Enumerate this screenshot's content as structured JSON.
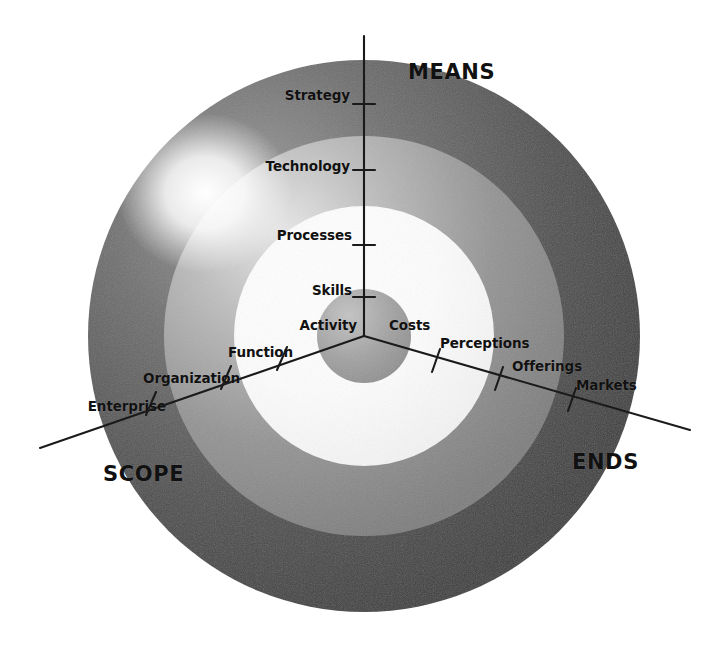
{
  "diagram": {
    "type": "concentric-ring-framework",
    "title_visible": false,
    "center": {
      "x": 364,
      "y": 336
    },
    "axes": [
      {
        "id": "means",
        "name": "MEANS",
        "label": "MEANS",
        "label_x": 456,
        "label_y": 73,
        "direction_deg": -90,
        "scale": [
          {
            "label": "Activity",
            "level": 1,
            "x": 352,
            "y": 325
          },
          {
            "label": "Skills",
            "level": 2,
            "x": 352,
            "y": 291
          },
          {
            "label": "Processes",
            "level": 3,
            "x": 352,
            "y": 235
          },
          {
            "label": "Technology",
            "level": 4,
            "x": 352,
            "y": 167
          },
          {
            "label": "Strategy",
            "level": 5,
            "x": 352,
            "y": 95
          }
        ]
      },
      {
        "id": "scope",
        "name": "SCOPE",
        "label": "SCOPE",
        "label_x": 105,
        "label_y": 474,
        "direction_deg": 199,
        "scale": [
          {
            "label": "Activity",
            "level": 1,
            "x": 354,
            "y": 325
          },
          {
            "label": "Function",
            "level": 2,
            "x": 290,
            "y": 353
          },
          {
            "label": "Organization",
            "level": 3,
            "x": 237,
            "y": 379
          },
          {
            "label": "Enterprise",
            "level": 4,
            "x": 163,
            "y": 407
          }
        ]
      },
      {
        "id": "ends",
        "name": "ENDS",
        "label": "ENDS",
        "label_x": 572,
        "label_y": 462,
        "direction_deg": -19,
        "scale": [
          {
            "label": "Costs",
            "level": 1,
            "x": 386,
            "y": 325
          },
          {
            "label": "Perceptions",
            "level": 2,
            "x": 440,
            "y": 343
          },
          {
            "label": "Offerings",
            "level": 3,
            "x": 512,
            "y": 366
          },
          {
            "label": "Markets",
            "level": 4,
            "x": 576,
            "y": 385
          }
        ]
      }
    ],
    "rings": [
      {
        "id": "hub",
        "label": "hub",
        "radius": 47,
        "color": "#9a9a9a"
      },
      {
        "id": "inner-white",
        "label": "inner zone",
        "radius": 130,
        "color": "#ffffff"
      },
      {
        "id": "mid-gray",
        "label": "middle zone",
        "radius": 200,
        "color": "#8c8c8c"
      },
      {
        "id": "outer-dark",
        "label": "outer zone",
        "radius": 276,
        "color": "#4b4b4b"
      }
    ],
    "colors": {
      "background": "#ffffff",
      "outer_ring": "#4b4b4b",
      "middle_ring": "#8c8c8c",
      "inner_ring": "#ffffff",
      "hub": "#9a9a9a",
      "axis_line": "#1a1a1a",
      "text": "#111111",
      "highlight": "#ffffff"
    },
    "highlight": {
      "x": 205,
      "y": 193,
      "radius": 95
    }
  }
}
